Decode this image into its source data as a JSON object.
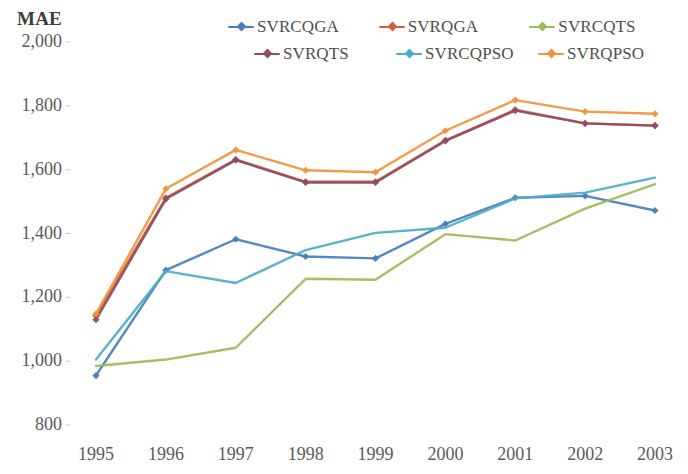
{
  "chart_data": {
    "type": "line",
    "title": "",
    "ylabel": "MAE",
    "xlabel": "",
    "ylim": [
      800,
      2000
    ],
    "ytick_labels": [
      "2,000",
      "1,800",
      "1,600",
      "1,400",
      "1,200",
      "1,000",
      "800"
    ],
    "ytick_values": [
      2000,
      1800,
      1600,
      1400,
      1200,
      1000,
      800
    ],
    "grid": false,
    "legend_position": "top",
    "categories": [
      "1995",
      "1996",
      "1997",
      "1998",
      "1999",
      "2000",
      "2001",
      "2002",
      "2003"
    ],
    "x": [
      1995,
      1996,
      1997,
      1998,
      1999,
      2000,
      2001,
      2002,
      2003
    ],
    "series": [
      {
        "name": "SVRCQGA",
        "color": "#4A7EBB",
        "marker": "diamond",
        "values": [
          955,
          1285,
          1382,
          1328,
          1322,
          1430,
          1512,
          1518,
          1472
        ]
      },
      {
        "name": "SVRQGA",
        "color": "#D1603D",
        "marker": "diamond",
        "values": [
          1142,
          1512,
          1632,
          1562,
          1562,
          1692,
          1788,
          1745,
          1738
        ]
      },
      {
        "name": "SVRCQTS",
        "color": "#9BBB59",
        "marker": "none",
        "values": [
          985,
          1005,
          1042,
          1258,
          1255,
          1398,
          1378,
          1478,
          1555
        ]
      },
      {
        "name": "SVRQTS",
        "color": "#8E4C62",
        "marker": "diamond",
        "values": [
          1130,
          1508,
          1630,
          1560,
          1560,
          1690,
          1785,
          1745,
          1738
        ]
      },
      {
        "name": "SVRCQPSO",
        "color": "#4BACC6",
        "marker": "none",
        "values": [
          1005,
          1282,
          1245,
          1348,
          1402,
          1418,
          1510,
          1528,
          1575
        ]
      },
      {
        "name": "SVRQPSO",
        "color": "#F0943B",
        "marker": "diamond",
        "values": [
          1148,
          1540,
          1662,
          1598,
          1592,
          1722,
          1818,
          1782,
          1775
        ]
      }
    ]
  },
  "legend": {
    "rows": [
      [
        {
          "label": "SVRCQGA",
          "color": "#4A7EBB",
          "marker": "diamond"
        },
        {
          "label": "SVRQGA",
          "color": "#D1603D",
          "marker": "diamond"
        },
        {
          "label": "SVRCQTS",
          "color": "#9BBB59",
          "marker": "diamond"
        }
      ],
      [
        {
          "label": "SVRQTS",
          "color": "#8E4C62",
          "marker": "diamond"
        },
        {
          "label": "SVRCQPSO",
          "color": "#4BACC6",
          "marker": "diamond"
        },
        {
          "label": "SVRQPSO",
          "color": "#F0943B",
          "marker": "diamond"
        }
      ]
    ]
  }
}
